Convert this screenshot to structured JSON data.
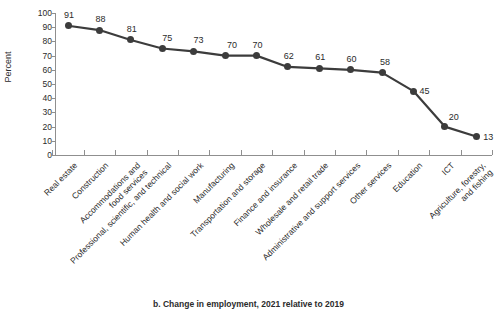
{
  "chart_data": {
    "type": "line",
    "title": "",
    "caption": "b. Change in employment, 2021 relative to 2019",
    "xlabel": "",
    "ylabel": "Percent",
    "ylim": [
      0,
      100
    ],
    "ytick_step": 10,
    "grid": false,
    "legend": "none",
    "line_color": "#3c3c3c",
    "marker_color": "#3c3c3c",
    "axis_color": "#8f8f8f",
    "background": "#ffffff",
    "ytick_labels": [
      "100",
      "90",
      "80",
      "70",
      "60",
      "50",
      "40",
      "30",
      "20",
      "10",
      "0"
    ],
    "categories": [
      "Real estate",
      "Construction",
      "Accommodations and\nfood services",
      "Professional, scientific, and technical",
      "Human health and social work",
      "Manufacturing",
      "Transportation and storage",
      "Finance and insurance",
      "Wholesale and retail trade",
      "Administrative and support services",
      "Other services",
      "Education",
      "ICT",
      "Agriculture, forestry,\nand fishing"
    ],
    "values": [
      91,
      88,
      81,
      75,
      73,
      70,
      70,
      62,
      61,
      60,
      58,
      45,
      20,
      13
    ],
    "data_labels": [
      "91",
      "88",
      "81",
      "75",
      "73",
      "70",
      "70",
      "62",
      "61",
      "60",
      "58",
      "45",
      "20",
      "13"
    ]
  }
}
